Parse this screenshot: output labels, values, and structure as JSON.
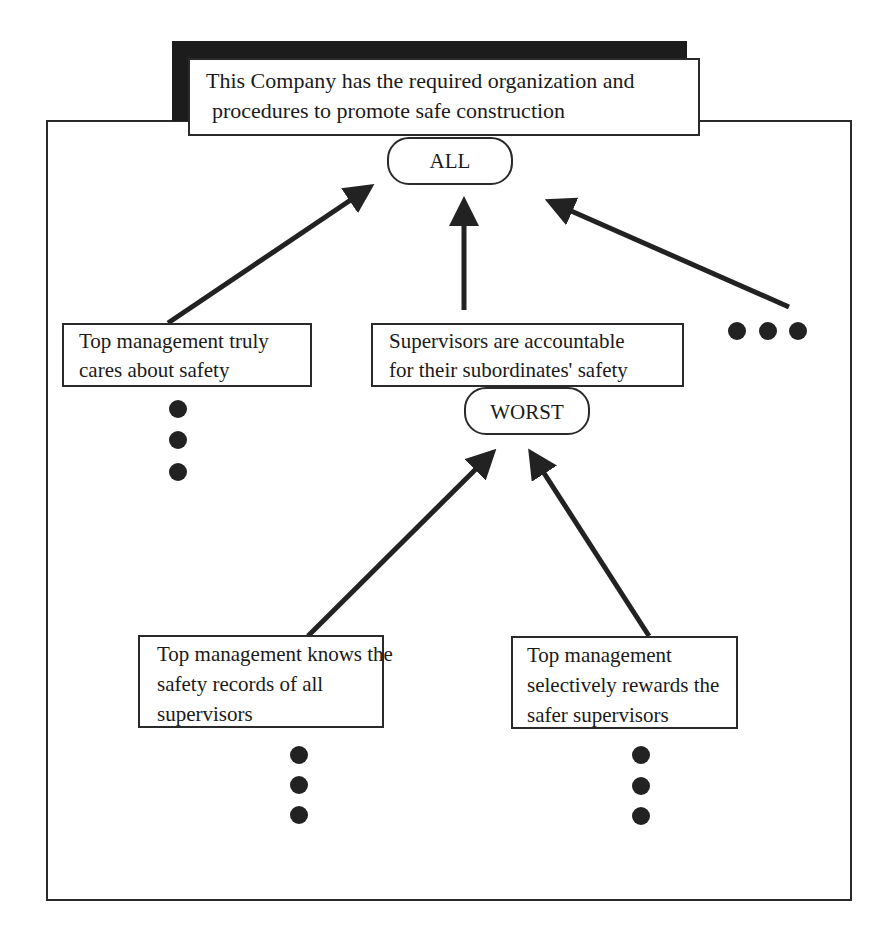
{
  "diagram": {
    "root": {
      "lines": [
        "This Company has the required organization and",
        "procedures to promote safe construction"
      ],
      "gate": "ALL"
    },
    "level1": [
      {
        "lines": [
          "Top management truly",
          "cares about safety"
        ]
      },
      {
        "lines": [
          "Supervisors are accountable",
          "for their subordinates' safety"
        ],
        "gate": "WORST"
      },
      {
        "ellipsis": "more-siblings"
      }
    ],
    "level2": [
      {
        "lines": [
          "Top management knows the",
          "safety records of all",
          "supervisors"
        ]
      },
      {
        "lines": [
          "Top management",
          "selectively rewards the",
          "safer supervisors"
        ]
      }
    ],
    "colors": {
      "stroke": "#2a2a2a",
      "shadow": "#1c1c1c",
      "dot": "#222222",
      "background": "#ffffff"
    }
  }
}
